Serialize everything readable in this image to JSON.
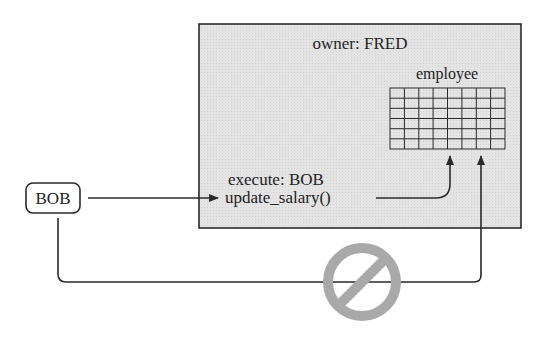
{
  "diagram": {
    "schema_box": {
      "owner_label": "owner: FRED",
      "table_label": "employee",
      "execute_label": "execute: BOB",
      "procedure_label": "update_salary()"
    },
    "user_box": {
      "label": "BOB"
    },
    "icons": {
      "prohibited": "prohibited-icon"
    },
    "colors": {
      "box_fill": "#e6e6e6",
      "stroke": "#2a2a2a",
      "prohibit": "#a9a9a9"
    },
    "grid": {
      "columns": 8,
      "rows": 6
    }
  }
}
